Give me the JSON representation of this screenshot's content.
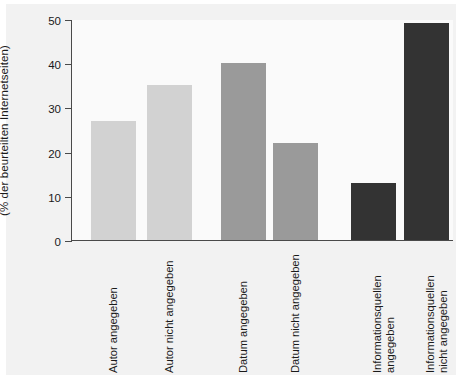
{
  "chart_data": {
    "type": "bar",
    "title": "",
    "xlabel": "",
    "ylabel": "(% der beurteilten Internetseiten)",
    "ylim": [
      0,
      50
    ],
    "yticks": [
      0,
      10,
      20,
      30,
      40,
      50
    ],
    "ytick_labels": [
      "0",
      "10",
      "20",
      "30",
      "40",
      "50"
    ],
    "grid": false,
    "legend": "none",
    "categories": [
      "Autor angegeben",
      "Autor nicht angegeben",
      "Datum angegeben",
      "Datum nicht angegeben",
      "Informationsquellen angegeben",
      "Informationsquellen nicht angegeben"
    ],
    "category_lines": [
      [
        "Autor angegeben"
      ],
      [
        "Autor nicht angegeben"
      ],
      [
        "Datum angegeben"
      ],
      [
        "Datum nicht angegeben"
      ],
      [
        "Informationsquellen",
        "angegeben"
      ],
      [
        "Informationsquellen",
        "nicht angegeben"
      ]
    ],
    "values": [
      27,
      35,
      40,
      22,
      13,
      49
    ],
    "bar_colors": [
      "#d2d2d2",
      "#d2d2d2",
      "#9a9a9a",
      "#9a9a9a",
      "#333333",
      "#333333"
    ],
    "background_color": "#f2f2f2",
    "plot_background_color": "#fafafa",
    "axis_color": "#4a4a4a"
  }
}
